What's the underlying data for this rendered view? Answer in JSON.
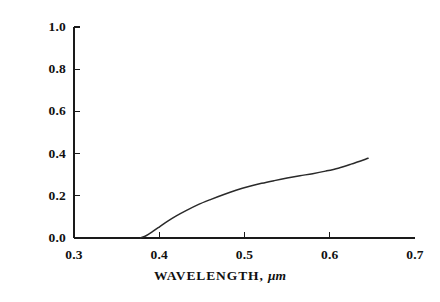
{
  "chart_data": {
    "type": "line",
    "title": "",
    "xlabel": "WAVELENGTH,",
    "xlabel_unit": "μm",
    "ylabel": "EXTERNAL TRANSMITTANCE",
    "xlim": [
      0.3,
      0.7
    ],
    "ylim": [
      0.0,
      1.0
    ],
    "grid": false,
    "legend": "none",
    "xticks": [
      "0.3",
      "0.4",
      "0.5",
      "0.6",
      "0.7"
    ],
    "xtick_values": [
      0.3,
      0.4,
      0.5,
      0.6,
      0.7
    ],
    "yticks": [
      "0.0",
      "0.2",
      "0.4",
      "0.6",
      "0.8",
      "1.0"
    ],
    "ytick_values": [
      0.0,
      0.2,
      0.4,
      0.6,
      0.8,
      1.0
    ],
    "series": [
      {
        "name": "external transmittance",
        "color": "#2a2a2a",
        "x": [
          0.378,
          0.385,
          0.392,
          0.4,
          0.41,
          0.42,
          0.432,
          0.445,
          0.46,
          0.475,
          0.49,
          0.505,
          0.52,
          0.535,
          0.55,
          0.565,
          0.58,
          0.595,
          0.61,
          0.625,
          0.645
        ],
        "y": [
          0.0,
          0.012,
          0.03,
          0.052,
          0.08,
          0.105,
          0.131,
          0.157,
          0.182,
          0.205,
          0.226,
          0.244,
          0.259,
          0.272,
          0.284,
          0.295,
          0.305,
          0.317,
          0.331,
          0.35,
          0.378
        ]
      }
    ]
  },
  "axes_geometry": {
    "left_px": 74,
    "right_px": 415,
    "top_px": 27,
    "bottom_px": 238,
    "tick_len_px": 6
  }
}
